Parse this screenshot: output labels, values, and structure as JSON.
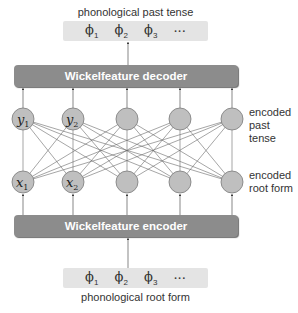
{
  "output": {
    "caption": "phonological past tense",
    "phonemes": [
      {
        "symbol": "ϕ",
        "sub": "1"
      },
      {
        "symbol": "ϕ",
        "sub": "2"
      },
      {
        "symbol": "ϕ",
        "sub": "3"
      },
      {
        "symbol": "···",
        "sub": ""
      }
    ]
  },
  "decoder": {
    "label": "Wickelfeature decoder"
  },
  "layers": {
    "past_tense": {
      "label_line1": "encoded",
      "label_line2": "past tense",
      "nodes": [
        {
          "var": "y",
          "sub": "1"
        },
        {
          "var": "y",
          "sub": "2"
        },
        {
          "var": "",
          "sub": ""
        },
        {
          "var": "",
          "sub": ""
        },
        {
          "var": "",
          "sub": ""
        }
      ]
    },
    "root_form": {
      "label_line1": "encoded",
      "label_line2": "root form",
      "nodes": [
        {
          "var": "x",
          "sub": "1"
        },
        {
          "var": "x",
          "sub": "2"
        },
        {
          "var": "",
          "sub": ""
        },
        {
          "var": "",
          "sub": ""
        },
        {
          "var": "",
          "sub": ""
        }
      ]
    }
  },
  "encoder": {
    "label": "Wickelfeature encoder"
  },
  "input": {
    "caption": "phonological root form",
    "phonemes": [
      {
        "symbol": "ϕ",
        "sub": "1"
      },
      {
        "symbol": "ϕ",
        "sub": "2"
      },
      {
        "symbol": "ϕ",
        "sub": "3"
      },
      {
        "symbol": "···",
        "sub": ""
      }
    ]
  },
  "colors": {
    "bar": "#8c8c8c",
    "phoneme_box": "#e4e4e4",
    "node_fill": "#bfbfbf",
    "node_stroke": "#7a7a7a",
    "edge": "#666666"
  }
}
